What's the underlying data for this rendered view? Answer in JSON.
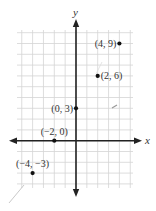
{
  "chart_data": {
    "type": "scatter",
    "title": "",
    "xlabel": "x",
    "ylabel": "y",
    "xlim": [
      -5.5,
      5.4
    ],
    "ylim": [
      -4.4,
      10.5
    ],
    "grid": true,
    "points": [
      {
        "x": 4,
        "y": 9,
        "label": "(4, 9)",
        "label_side": "left"
      },
      {
        "x": 2,
        "y": 6,
        "label": "(2, 6)",
        "label_side": "right"
      },
      {
        "x": 0,
        "y": 3,
        "label": "(0, 3)",
        "label_side": "left"
      },
      {
        "x": -2,
        "y": 0,
        "label": "(−2, 0)",
        "label_side": "above"
      },
      {
        "x": -4,
        "y": -3,
        "label": "(−4, −3)",
        "label_side": "above"
      }
    ]
  },
  "axes": {
    "x_label": "x",
    "y_label": "y"
  },
  "colors": {
    "axis": "#222222",
    "grid": "#d4d4d4",
    "point": "#111111",
    "text": "#333333"
  }
}
